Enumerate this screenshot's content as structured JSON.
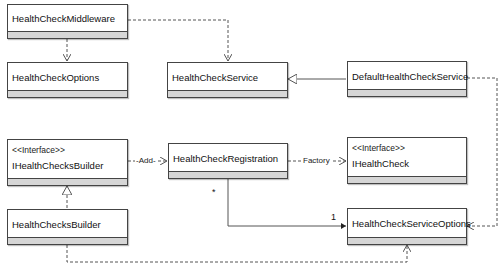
{
  "diagram": {
    "type": "uml-class-diagram",
    "classes": [
      {
        "id": "middleware",
        "name": "HealthCheckMiddleware",
        "stereotype": ""
      },
      {
        "id": "options",
        "name": "HealthCheckOptions",
        "stereotype": ""
      },
      {
        "id": "service",
        "name": "HealthCheckService",
        "stereotype": ""
      },
      {
        "id": "default_service",
        "name": "DefaultHealthCheckService",
        "stereotype": ""
      },
      {
        "id": "ibuilder",
        "name": "IHealthChecksBuilder",
        "stereotype": "<<Interface>>"
      },
      {
        "id": "registration",
        "name": "HealthCheckRegistration",
        "stereotype": ""
      },
      {
        "id": "ihealthcheck",
        "name": "IHealthCheck",
        "stereotype": "<<Interface>>"
      },
      {
        "id": "builder",
        "name": "HealthChecksBuilder",
        "stereotype": ""
      },
      {
        "id": "service_options",
        "name": "HealthCheckServiceOptions",
        "stereotype": ""
      }
    ],
    "relations": [
      {
        "from": "HealthCheckMiddleware",
        "to": "HealthCheckOptions",
        "kind": "dependency",
        "label": ""
      },
      {
        "from": "HealthCheckMiddleware",
        "to": "HealthCheckService",
        "kind": "dependency",
        "label": ""
      },
      {
        "from": "DefaultHealthCheckService",
        "to": "HealthCheckService",
        "kind": "generalization",
        "label": ""
      },
      {
        "from": "DefaultHealthCheckService",
        "to": "HealthCheckServiceOptions",
        "kind": "dependency",
        "label": ""
      },
      {
        "from": "IHealthChecksBuilder",
        "to": "HealthCheckRegistration",
        "kind": "dependency",
        "label": "Add"
      },
      {
        "from": "HealthCheckRegistration",
        "to": "IHealthCheck",
        "kind": "dependency",
        "label": "Factory"
      },
      {
        "from": "HealthChecksBuilder",
        "to": "IHealthChecksBuilder",
        "kind": "realization",
        "label": ""
      },
      {
        "from": "HealthChecksBuilder",
        "to": "HealthCheckServiceOptions",
        "kind": "dependency",
        "label": ""
      },
      {
        "from": "HealthCheckRegistration",
        "to": "HealthCheckServiceOptions",
        "kind": "association",
        "label": "",
        "from_multiplicity": "*",
        "to_multiplicity": "1"
      }
    ],
    "labels": {
      "add": "-Add-",
      "factory": "Factory",
      "mult_many": "*",
      "mult_one": "1"
    },
    "colors": {
      "line": "#555555",
      "box_border": "#444444",
      "band": "#d6d6d6"
    }
  }
}
